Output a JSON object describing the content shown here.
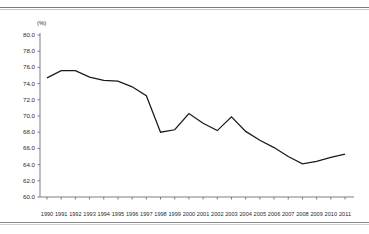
{
  "chart_data": {
    "type": "line",
    "title": "",
    "subtitle": "",
    "xlabel": "",
    "ylabel": "(%)",
    "unit_label": "(%)",
    "grid": false,
    "legend": null,
    "ylim": [
      60.0,
      80.0
    ],
    "ytick_step": 2.0,
    "ytick_labels": [
      "80.0",
      "78.0",
      "76.0",
      "74.0",
      "72.0",
      "70.0",
      "68.0",
      "66.0",
      "64.0",
      "62.0",
      "60.0"
    ],
    "ytick_values": [
      80.0,
      78.0,
      76.0,
      74.0,
      72.0,
      70.0,
      68.0,
      66.0,
      64.0,
      62.0,
      60.0
    ],
    "categories": [
      "1990",
      "1991",
      "1992",
      "1993",
      "1994",
      "1995",
      "1996",
      "1997",
      "1998",
      "1999",
      "2000",
      "2001",
      "2002",
      "2003",
      "2004",
      "2005",
      "2006",
      "2007",
      "2008",
      "2009",
      "2010",
      "2011"
    ],
    "x": [
      1990,
      1991,
      1992,
      1993,
      1994,
      1995,
      1996,
      1997,
      1998,
      1999,
      2000,
      2001,
      2002,
      2003,
      2004,
      2005,
      2006,
      2007,
      2008,
      2009,
      2010,
      2011
    ],
    "values": [
      74.7,
      75.6,
      75.6,
      74.8,
      74.4,
      74.3,
      73.6,
      72.5,
      68.0,
      68.3,
      70.3,
      69.1,
      68.2,
      69.9,
      68.1,
      67.0,
      66.1,
      65.0,
      64.1,
      64.4,
      64.9,
      65.3
    ],
    "series": [
      {
        "name": "",
        "color": "#1a1a1a",
        "values": [
          74.7,
          75.6,
          75.6,
          74.8,
          74.4,
          74.3,
          73.6,
          72.5,
          68.0,
          68.3,
          70.3,
          69.1,
          68.2,
          69.9,
          68.1,
          67.0,
          66.1,
          65.0,
          64.1,
          64.4,
          64.9,
          65.3
        ]
      }
    ]
  },
  "colors": {
    "line": "#1a1a1a",
    "axis": "#6f6f6f",
    "text": "#2b2b2b",
    "rule": "#7b7b7b",
    "background": "#ffffff"
  }
}
